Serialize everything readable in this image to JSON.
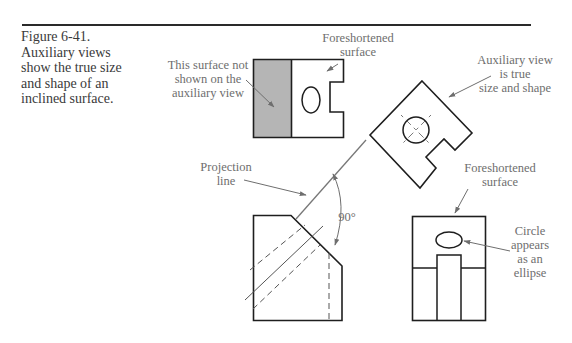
{
  "caption": {
    "figure_number": "Figure 6-41.",
    "lines": [
      "Auxiliary views",
      "show the true size",
      "and shape of an",
      "inclined surface."
    ]
  },
  "labels": {
    "surface_not_shown": [
      "This surface not",
      "shown on the",
      "auxiliary view"
    ],
    "foreshortened_top": [
      "Foreshortened",
      "surface"
    ],
    "auxiliary_true": [
      "Auxiliary view",
      "is true",
      "size and shape"
    ],
    "projection_line": [
      "Projection",
      "line"
    ],
    "angle": "90°",
    "foreshortened_bottom": [
      "Foreshortened",
      "surface"
    ],
    "circle_ellipse": [
      "Circle",
      "appears",
      "as an",
      "ellipse"
    ]
  },
  "colors": {
    "line": "#1e1e1e",
    "shaded_surface": "#b5b5b5",
    "annotation": "#6e6e6e",
    "leader": "#6e6e6e"
  }
}
